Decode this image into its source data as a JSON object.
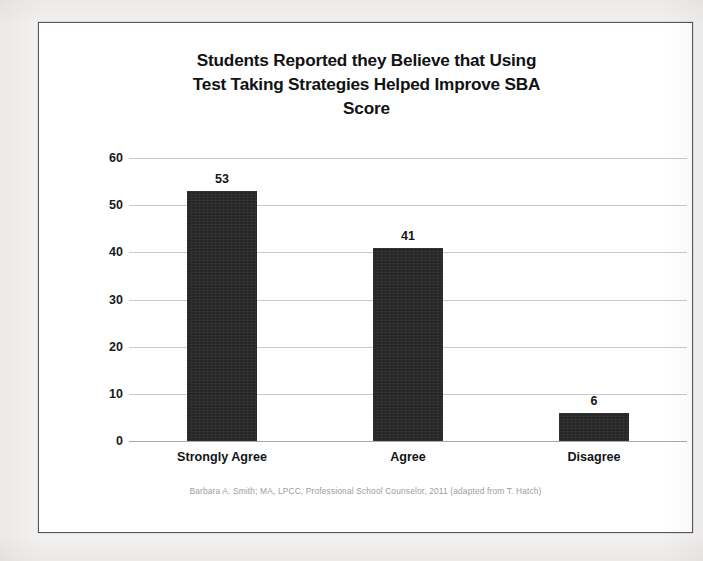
{
  "chart_data": {
    "type": "bar",
    "title": "Students Reported they Believe that Using Test Taking Strategies Helped Improve SBA Score",
    "title_lines": [
      "Students Reported they Believe that Using",
      "Test Taking Strategies Helped Improve SBA",
      "Score"
    ],
    "categories": [
      "Strongly Agree",
      "Agree",
      "Disagree"
    ],
    "values": [
      53,
      41,
      6
    ],
    "value_labels": [
      "53",
      "41",
      "6"
    ],
    "xlabel": "",
    "ylabel": "",
    "ylim": [
      0,
      60
    ],
    "ytick_step": 10,
    "yticks": [
      0,
      10,
      20,
      30,
      40,
      50,
      60
    ],
    "ytick_labels": [
      "0",
      "10",
      "20",
      "30",
      "40",
      "50",
      "60"
    ],
    "grid": true,
    "grid_axis": "y",
    "legend": false,
    "legend_position": "none",
    "bar_color": "#262627",
    "gridline_color": "#c9c9cc",
    "axis_color": "#a9a9ad",
    "text_color": "#141517",
    "plot_background": "#ffffff"
  },
  "footer": {
    "credit": "Barbara A. Smith; MA, LPCC, Professional School Counselor, 2011 (adapted from T. Hatch)",
    "color": "#9b9da1"
  },
  "page": {
    "background": "#f4f2f0",
    "card_background": "#ffffff",
    "card_border": "#55585c"
  }
}
